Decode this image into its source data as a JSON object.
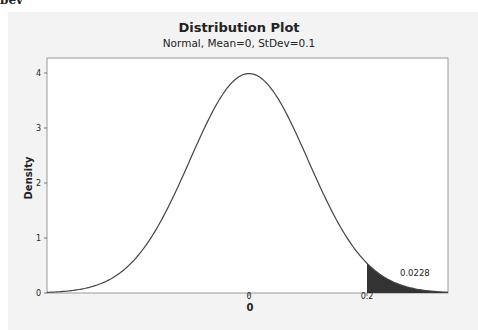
{
  "page": {
    "clipped_header_text": "bev"
  },
  "chart_data": {
    "type": "line",
    "title": "Distribution Plot",
    "subtitle": "Normal, Mean=0, StDev=0.1",
    "distribution": "Normal",
    "mean": 0,
    "stdev": 0.1,
    "xlabel": "0",
    "ylabel": "Density",
    "x_ticks": [
      "0",
      "0.2"
    ],
    "y_ticks": [
      "0",
      "1",
      "2",
      "3",
      "4"
    ],
    "ylim": [
      0,
      4.2
    ],
    "xlim": [
      -0.34,
      0.34
    ],
    "grid": false,
    "legend": "none",
    "shaded_region": {
      "from_x": 0.2,
      "to_x": "inf",
      "probability": "0.0228",
      "color": "#333333"
    },
    "annotations": [
      "0.0228"
    ],
    "x": [
      -0.34,
      -0.3,
      -0.25,
      -0.2,
      -0.15,
      -0.1,
      -0.05,
      0,
      0.05,
      0.1,
      0.15,
      0.2,
      0.25,
      0.3,
      0.34
    ],
    "y": [
      0.012,
      0.044,
      0.175,
      0.54,
      1.295,
      2.42,
      3.521,
      3.989,
      3.521,
      2.42,
      1.295,
      0.54,
      0.175,
      0.044,
      0.012
    ]
  },
  "labels": {
    "x_tick_0": "0",
    "x_tick_1": "0.2",
    "y_tick_0": "0",
    "y_tick_1": "1",
    "y_tick_2": "2",
    "y_tick_3": "3",
    "y_tick_4": "4",
    "area_value": "0.0228"
  }
}
